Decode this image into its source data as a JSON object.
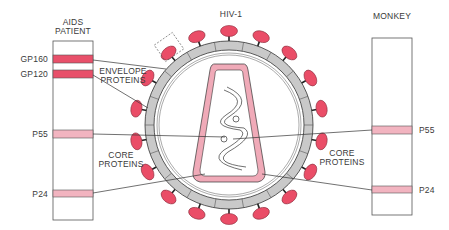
{
  "title": "HIV-1",
  "colors": {
    "strong_band": "#e8506a",
    "faint_band": "#f2b4c0",
    "spike": "#ea4d67",
    "ring_gray": "#c9c9c9",
    "core_pink": "#f0aab8",
    "line": "#333333"
  },
  "left_panel": {
    "title_line1": "AIDS",
    "title_line2": "PATIENT",
    "bands": [
      {
        "label": "GP160",
        "intensity": "strong"
      },
      {
        "label": "GP120",
        "intensity": "strong"
      },
      {
        "label": "P55",
        "intensity": "faint"
      },
      {
        "label": "P24",
        "intensity": "faint"
      }
    ]
  },
  "right_panel": {
    "title": "MONKEY",
    "bands": [
      {
        "label": "P55",
        "intensity": "faint"
      },
      {
        "label": "P24",
        "intensity": "faint"
      }
    ]
  },
  "annotations": {
    "envelope_line1": "ENVELOPE",
    "envelope_line2": "PROTEINS",
    "core_left_line1": "CORE",
    "core_left_line2": "PROTEINS",
    "core_right_line1": "CORE",
    "core_right_line2": "PROTEINS"
  }
}
